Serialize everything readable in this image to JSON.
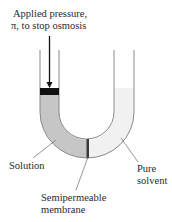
{
  "title": {
    "line1": "Applied pressure,",
    "line2": "π, to stop osmosis"
  },
  "labels": {
    "solution": "Solution",
    "pure_line1": "Pure",
    "pure_line2": "solvent",
    "membrane_line1": "Semipermeable",
    "membrane_line2": "membrane"
  },
  "colors": {
    "solution_fill": "#c6c6c6",
    "solvent_fill": "#f1f1f1",
    "tube_wall": "#8a8a8a",
    "piston": "#111111",
    "membrane": "#3a3a3a",
    "leader": "#6a6a6a",
    "text": "#2a2a2a"
  }
}
